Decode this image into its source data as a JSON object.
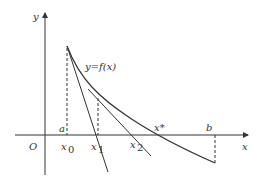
{
  "figure": {
    "curve_label": "y=f(x)",
    "axis_labels": {
      "x": "x",
      "y": "y",
      "origin": "O"
    },
    "point_labels": {
      "a": "a",
      "b": "b",
      "x0": "x",
      "x0_sub": "0",
      "x1": "x",
      "x1_sub": "1",
      "x2": "x",
      "x2_sub": "2",
      "xstar": "x*"
    },
    "colors": {
      "stroke": "#333333",
      "background": "#ffffff"
    }
  }
}
